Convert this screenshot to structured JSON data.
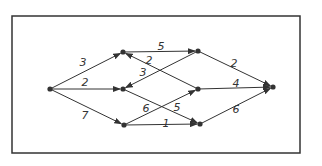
{
  "graph": {
    "frame": {
      "x": 12,
      "y": 16,
      "w": 288,
      "h": 137
    },
    "nodes": [
      {
        "id": "S",
        "x": 50,
        "y": 89
      },
      {
        "id": "A",
        "x": 123,
        "y": 52
      },
      {
        "id": "B",
        "x": 123,
        "y": 89
      },
      {
        "id": "C",
        "x": 124,
        "y": 125
      },
      {
        "id": "D",
        "x": 198,
        "y": 51
      },
      {
        "id": "E",
        "x": 198,
        "y": 89
      },
      {
        "id": "F",
        "x": 200,
        "y": 124
      },
      {
        "id": "T",
        "x": 273,
        "y": 87
      }
    ],
    "edges": [
      {
        "from": "S",
        "to": "A",
        "weight": "3",
        "lx": 83,
        "ly": 66
      },
      {
        "from": "S",
        "to": "B",
        "weight": "2",
        "lx": 85,
        "ly": 86
      },
      {
        "from": "S",
        "to": "C",
        "weight": "7",
        "lx": 85,
        "ly": 119
      },
      {
        "from": "A",
        "to": "D",
        "weight": "5",
        "lx": 161,
        "ly": 50
      },
      {
        "from": "E",
        "to": "A",
        "weight": "2",
        "lx": 149,
        "ly": 64
      },
      {
        "from": "D",
        "to": "B",
        "weight": "3",
        "lx": 143,
        "ly": 76
      },
      {
        "from": "B",
        "to": "F",
        "weight": "5",
        "lx": 177,
        "ly": 111
      },
      {
        "from": "C",
        "to": "E",
        "weight": "6",
        "lx": 146,
        "ly": 112
      },
      {
        "from": "C",
        "to": "F",
        "weight": "1",
        "lx": 166,
        "ly": 127
      },
      {
        "from": "D",
        "to": "T",
        "weight": "2",
        "lx": 234,
        "ly": 67
      },
      {
        "from": "E",
        "to": "T",
        "weight": "4",
        "lx": 236,
        "ly": 87
      },
      {
        "from": "F",
        "to": "T",
        "weight": "6",
        "lx": 236,
        "ly": 113
      }
    ],
    "colors": {
      "line": "#333333",
      "bg": "#ffffff"
    }
  }
}
